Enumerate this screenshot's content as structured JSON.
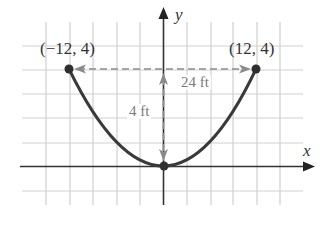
{
  "figure": {
    "type": "parabola-diagram",
    "grid": {
      "origin_px": [
        164,
        166
      ],
      "unit_px_x": 23.4,
      "unit_px_y": 24.2,
      "x_range_units": [
        -6,
        5
      ],
      "y_range_units": [
        -1,
        6
      ],
      "grid_color": "#cfcfcf"
    },
    "axes": {
      "x_label": "x",
      "y_label": "y",
      "color": "#333333"
    },
    "curve": {
      "equation_hint": "y = x^2 / 36 (vertex at origin)",
      "color": "#3a3a3a",
      "vertex": [
        0,
        0
      ],
      "endpoints": [
        [
          -12,
          4
        ],
        [
          12,
          4
        ]
      ]
    },
    "points": [
      {
        "label": "(−12, 4)",
        "x": -12,
        "y": 4
      },
      {
        "label": "(12, 4)",
        "x": 12,
        "y": 4
      },
      {
        "label": "",
        "x": 0,
        "y": 0
      }
    ],
    "dimensions": {
      "width_label": "24 ft",
      "height_label": "4 ft",
      "dash_color": "#8a8a8a"
    }
  }
}
